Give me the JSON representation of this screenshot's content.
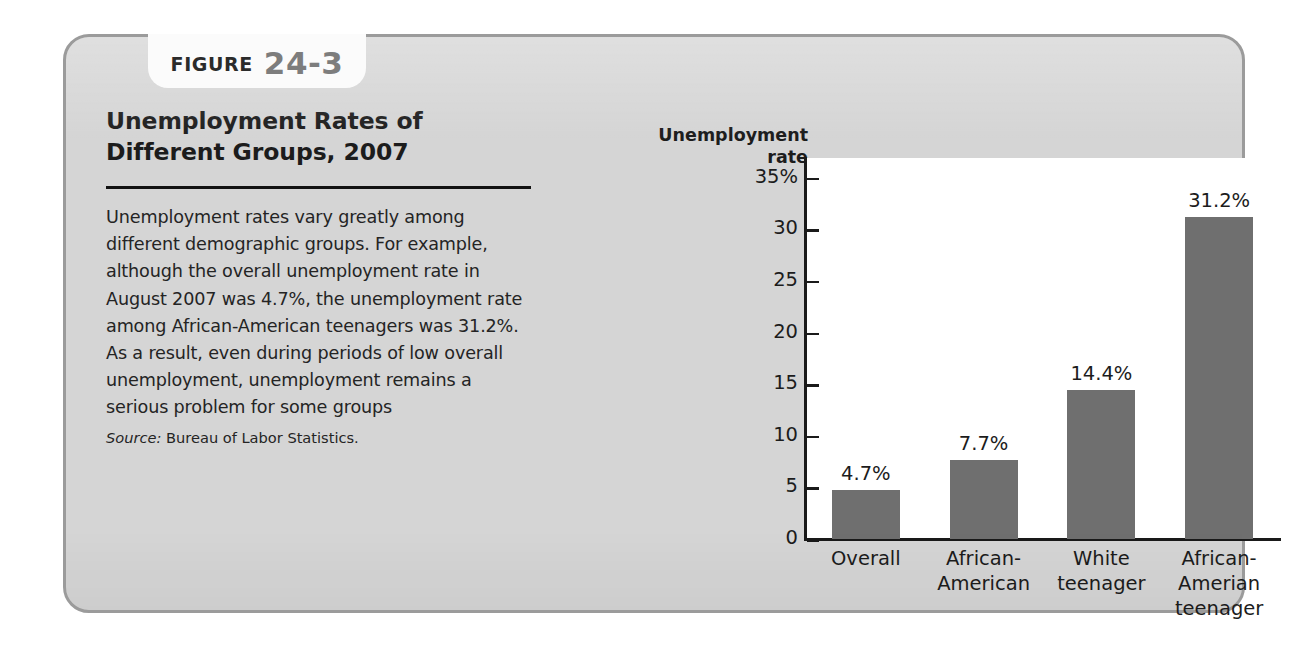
{
  "figure": {
    "tab_word": "FIGURE",
    "tab_number": "24-3",
    "title": "Unemployment Rates of\nDifferent Groups, 2007",
    "body": "Unemployment rates vary greatly among different demographic groups. For example, although the overall unemployment rate in August 2007 was 4.7%, the unemployment rate among African-American teenagers was 31.2%. As a result, even during periods of low overall unemployment, unemployment remains a serious problem for some groups",
    "source_label": "Source:",
    "source_text": "Bureau of Labor Statistics."
  },
  "colors": {
    "card_background": "#d5d5d5",
    "card_border": "#9b9b9b",
    "tab_background": "#fbfbfb",
    "bar_fill": "#6f6f6f",
    "axis": "#1a1a1a",
    "plot_background": "#ffffff",
    "text": "#1c1c1c"
  },
  "chart_data": {
    "type": "bar",
    "title": "",
    "xlabel": "",
    "ylabel": "Unemployment\nrate",
    "ylim": [
      0,
      37
    ],
    "grid": false,
    "legend": "none",
    "ytick_values": [
      35,
      30,
      25,
      20,
      15,
      10,
      5,
      0
    ],
    "ytick_labels": [
      "35%",
      "30",
      "25",
      "20",
      "15",
      "10",
      "5",
      "0"
    ],
    "categories": [
      "Overall",
      "African-\nAmerican",
      "White\nteenager",
      "African-\nAmerian\nteenager"
    ],
    "values": [
      4.7,
      7.7,
      14.4,
      31.2
    ],
    "value_labels": [
      "4.7%",
      "7.7%",
      "14.4%",
      "31.2%"
    ]
  }
}
